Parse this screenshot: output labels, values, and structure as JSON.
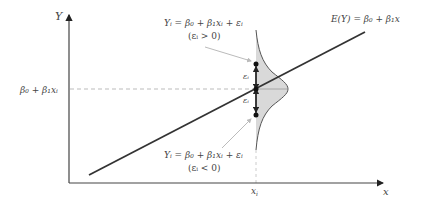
{
  "diagram": {
    "axes": {
      "y_label": "Y",
      "x_label": "x",
      "x_tick_label": "x",
      "x_tick_sub": "i",
      "y_tick_label": "β₀ + β₁xᵢ"
    },
    "regression_line": {
      "label": "E(Y) = β₀ + β₁x",
      "color": "#333333"
    },
    "points": {
      "upper": {
        "equation": "Yᵢ = β₀ + β₁xᵢ + εᵢ",
        "condition": "(εᵢ > 0)"
      },
      "lower": {
        "equation": "Yᵢ = β₀ + β₁xᵢ + εᵢ",
        "condition": "(εᵢ < 0)"
      }
    },
    "error_labels": {
      "upper": "εᵢ",
      "lower": "εᵢ"
    },
    "distribution": {
      "fill": "#d9d9d9",
      "stroke": "#555555"
    }
  }
}
